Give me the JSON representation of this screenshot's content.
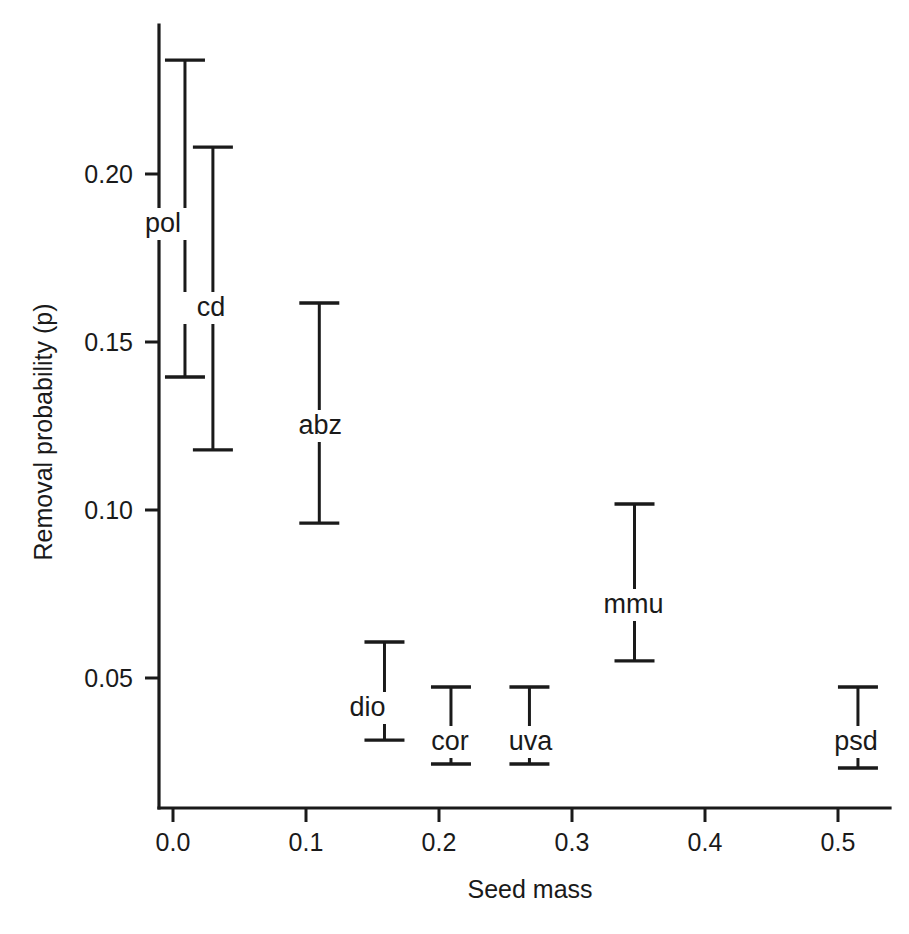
{
  "chart_data": {
    "type": "scatter",
    "title": "",
    "subtitle": "",
    "xlabel": "Seed mass",
    "ylabel": "Removal probability (p)",
    "xlim": [
      -0.02,
      0.54
    ],
    "ylim": [
      0.018,
      0.242
    ],
    "xticks": [
      0.0,
      0.1,
      0.2,
      0.3,
      0.4,
      0.5
    ],
    "xtick_labels": [
      "0.0",
      "0.1",
      "0.2",
      "0.3",
      "0.4",
      "0.5"
    ],
    "yticks": [
      0.05,
      0.1,
      0.15,
      0.2
    ],
    "ytick_labels": [
      "0.05",
      "0.10",
      "0.15",
      "0.20"
    ],
    "grid": false,
    "legend": "none",
    "error_style": "vertical-interval-with-caps",
    "series": [
      {
        "name": "Removal probability interval",
        "points": [
          {
            "label": "pol",
            "x": 0.009,
            "low": 0.1396,
            "high": 0.2339,
            "label_dx": -22,
            "label_dy": 232
          },
          {
            "label": "cd",
            "x": 0.03,
            "low": 0.1179,
            "high": 0.208,
            "label_dx": -2,
            "label_dy": 316
          },
          {
            "label": "abz",
            "x": 0.11,
            "low": 0.0961,
            "high": 0.1616,
            "label_dx": 1,
            "label_dy": 434
          },
          {
            "label": "dio",
            "x": 0.159,
            "low": 0.0315,
            "high": 0.0607,
            "label_dx": -17,
            "label_dy": 716
          },
          {
            "label": "cor",
            "x": 0.209,
            "low": 0.0244,
            "high": 0.0473,
            "label_dx": -1,
            "label_dy": 750
          },
          {
            "label": "uva",
            "x": 0.268,
            "low": 0.0244,
            "high": 0.0473,
            "label_dx": 1,
            "label_dy": 750
          },
          {
            "label": "mmu",
            "x": 0.347,
            "low": 0.0551,
            "high": 0.1018,
            "label_dx": -1,
            "label_dy": 613
          },
          {
            "label": "psd",
            "x": 0.515,
            "low": 0.0232,
            "high": 0.0473,
            "label_dx": -2,
            "label_dy": 750
          }
        ]
      }
    ]
  },
  "geometry": {
    "x_origin_px": 173,
    "x_unit_px": 1330,
    "y_ref_value": 0.2,
    "y_ref_px": 174,
    "y_unit_px": 3360,
    "axis_left_px": 159,
    "axis_top_px": 25,
    "axis_bottom_px": 808,
    "axis_right_px": 890,
    "cap_half_width_px": 20,
    "tick_len_px": 14
  },
  "colors": {
    "ink": "#1a1a1a",
    "background": "#ffffff"
  }
}
